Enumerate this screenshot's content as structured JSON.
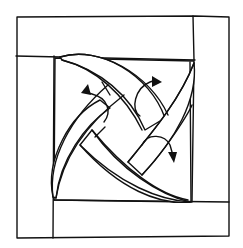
{
  "diagram": {
    "type": "hand-drawn woven square block sketch",
    "colors": {
      "stroke": "#111111",
      "background": "#ffffff"
    },
    "elements": {
      "outer_frame": "outer square border",
      "frame_strips": [
        "top strip",
        "right strip",
        "bottom strip",
        "left strip"
      ],
      "inner_square": "center square",
      "woven_bands": [
        "band top-left to bottom-right (upper)",
        "band top-left to bottom-right (lower)",
        "band bottom-left to top-right (left)",
        "band bottom-left to top-right (right)"
      ],
      "arrows": [
        "curved arrow left",
        "curved arrow top",
        "curved arrow right-down"
      ]
    }
  }
}
